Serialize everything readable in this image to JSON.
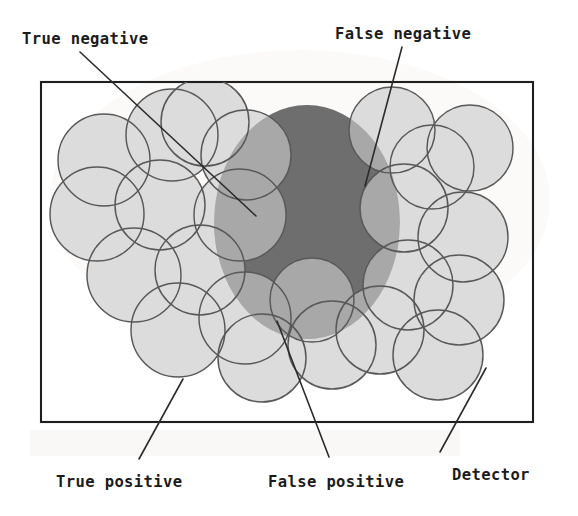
{
  "figure": {
    "type": "diagram",
    "background_color": "#ffffff",
    "frame": {
      "name": "region-of-interest-rectangle",
      "x": 41,
      "y": 82,
      "width": 492,
      "height": 340,
      "stroke": "#1f1f1f"
    },
    "regions": {
      "target_uncovered": {
        "role": "False negative",
        "color": "#6e6e6e",
        "description": "dark grey part of the target ellipse not covered by any detector"
      },
      "target_covered": {
        "role": "True positive",
        "color": "#a8a8a8",
        "description": "medium grey overlap of target ellipse and detector union"
      },
      "covered_nontarget": {
        "role": "False positive",
        "color": "#dcdcdc",
        "description": "very light grey detector area falling outside the target"
      },
      "uncovered_nontarget": {
        "role": "True negative",
        "color": "#ffffff",
        "description": "white area inside the rectangle with no target and no detector"
      },
      "detector_outline_color": "#585858"
    },
    "target_ellipse": {
      "cx": 307,
      "cy": 222,
      "rx": 93,
      "ry": 117
    },
    "covered_ellipse": {
      "cx": 284,
      "cy": 248,
      "rx": 92,
      "ry": 104
    },
    "detectors": [
      {
        "cx": 104,
        "cy": 160,
        "r": 46
      },
      {
        "cx": 172,
        "cy": 135,
        "r": 46
      },
      {
        "cx": 205,
        "cy": 122,
        "r": 44
      },
      {
        "cx": 97,
        "cy": 214,
        "r": 47
      },
      {
        "cx": 160,
        "cy": 205,
        "r": 45
      },
      {
        "cx": 134,
        "cy": 275,
        "r": 47
      },
      {
        "cx": 200,
        "cy": 270,
        "r": 45
      },
      {
        "cx": 178,
        "cy": 330,
        "r": 47
      },
      {
        "cx": 245,
        "cy": 318,
        "r": 46
      },
      {
        "cx": 262,
        "cy": 358,
        "r": 44
      },
      {
        "cx": 240,
        "cy": 215,
        "r": 46
      },
      {
        "cx": 246,
        "cy": 155,
        "r": 45
      },
      {
        "cx": 392,
        "cy": 130,
        "r": 43
      },
      {
        "cx": 432,
        "cy": 167,
        "r": 42
      },
      {
        "cx": 470,
        "cy": 148,
        "r": 43
      },
      {
        "cx": 404,
        "cy": 208,
        "r": 44
      },
      {
        "cx": 463,
        "cy": 237,
        "r": 45
      },
      {
        "cx": 408,
        "cy": 285,
        "r": 45
      },
      {
        "cx": 459,
        "cy": 300,
        "r": 45
      },
      {
        "cx": 380,
        "cy": 330,
        "r": 44
      },
      {
        "cx": 438,
        "cy": 355,
        "r": 45
      },
      {
        "cx": 332,
        "cy": 345,
        "r": 44
      },
      {
        "cx": 312,
        "cy": 300,
        "r": 42
      }
    ],
    "labels": [
      {
        "id": "true-negative",
        "text": "True negative",
        "text_x": 22,
        "text_y": 44,
        "leader": {
          "x1": 80,
          "y1": 52,
          "x2": 256,
          "y2": 216
        }
      },
      {
        "id": "false-negative",
        "text": "False negative",
        "text_x": 335,
        "text_y": 39,
        "leader": {
          "x1": 402,
          "y1": 47,
          "x2": 365,
          "y2": 186
        }
      },
      {
        "id": "true-positive",
        "text": "True positive",
        "text_x": 56,
        "text_y": 487,
        "leader": {
          "x1": 183,
          "y1": 379,
          "x2": 139,
          "y2": 459
        }
      },
      {
        "id": "false-positive",
        "text": "False positive",
        "text_x": 268,
        "text_y": 487,
        "leader": {
          "x1": 277,
          "y1": 321,
          "x2": 329,
          "y2": 457
        }
      },
      {
        "id": "detector",
        "text": "Detector",
        "text_x": 452,
        "text_y": 480,
        "leader": {
          "x1": 486,
          "y1": 368,
          "x2": 440,
          "y2": 452
        }
      }
    ]
  }
}
